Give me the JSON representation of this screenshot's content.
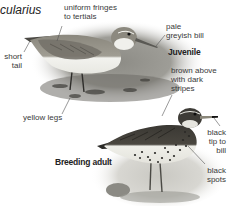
{
  "species": {
    "scientific_name_fragment": "cularius"
  },
  "juvenile": {
    "stage_label": "Juvenile",
    "annotations": [
      {
        "id": "tertials",
        "lines": [
          "uniform fringes",
          "to tertials"
        ]
      },
      {
        "id": "bill",
        "lines": [
          "pale",
          "greyish bill"
        ]
      },
      {
        "id": "tail",
        "lines": [
          "short",
          "tail"
        ]
      },
      {
        "id": "legs",
        "lines": [
          "yellow legs"
        ]
      }
    ]
  },
  "adult": {
    "stage_label": "Breeding adult",
    "annotations": [
      {
        "id": "upperparts",
        "lines": [
          "brown above",
          "with dark",
          "stripes"
        ]
      },
      {
        "id": "bill-tip",
        "lines": [
          "black",
          "tip to",
          "bill"
        ]
      },
      {
        "id": "spots",
        "lines": [
          "black",
          "spots"
        ]
      }
    ]
  },
  "colors": {
    "text": "#3a3a3a",
    "leader_line": "#555555",
    "bird_dark": "#3b3a36",
    "bird_mid": "#7a7a72",
    "belly_light": "#eeeeea",
    "background_vignette": "#8a8a84"
  }
}
